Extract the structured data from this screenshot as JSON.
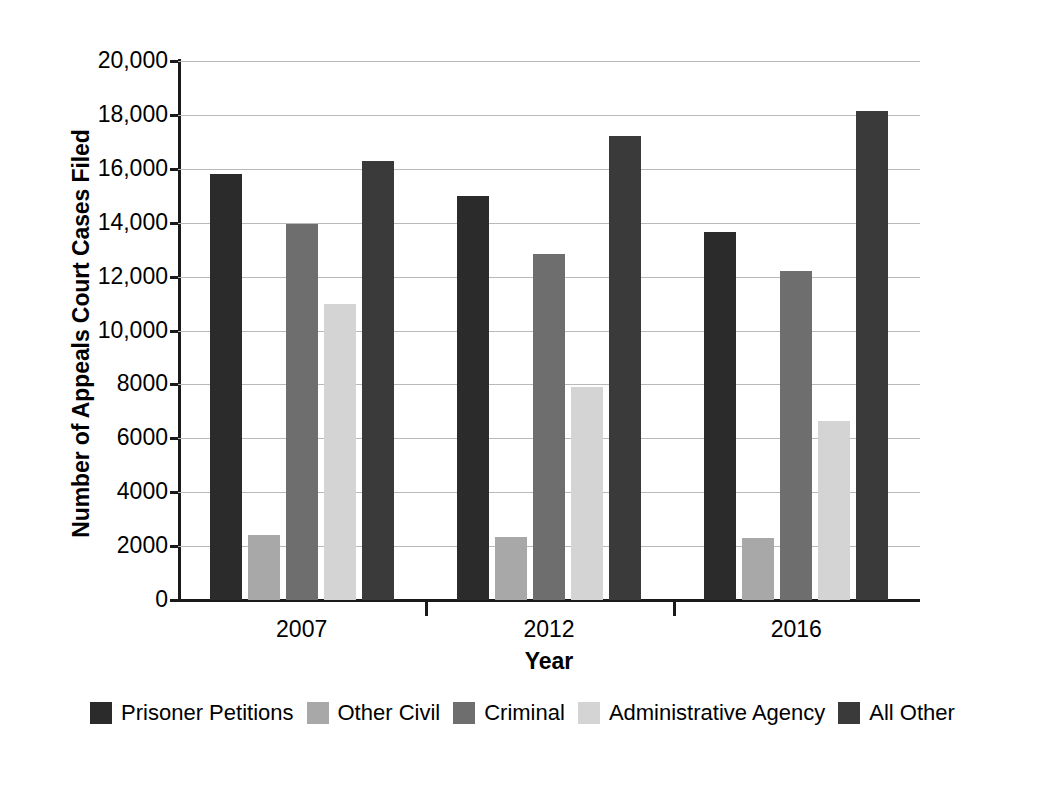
{
  "chart_data": {
    "type": "bar",
    "title": "",
    "xlabel": "Year",
    "ylabel": "Number of Appeals Court Cases Filed",
    "categories": [
      "2007",
      "2012",
      "2016"
    ],
    "ylim": [
      0,
      20000
    ],
    "ytick_values": [
      0,
      2000,
      4000,
      6000,
      8000,
      10000,
      12000,
      14000,
      16000,
      18000,
      20000
    ],
    "ytick_labels": [
      "0",
      "2000",
      "4000",
      "6000",
      "8000",
      "10,000",
      "12,000",
      "14,000",
      "16,000",
      "18,000",
      "20,000"
    ],
    "grid": true,
    "legend_position": "bottom",
    "series": [
      {
        "name": "Prisoner Petitions",
        "color": "#2b2b2b",
        "values": [
          15800,
          15000,
          13650
        ]
      },
      {
        "name": "Other Civil",
        "color": "#a8a8a8",
        "values": [
          2400,
          2350,
          2300
        ]
      },
      {
        "name": "Criminal",
        "color": "#6e6e6e",
        "values": [
          13950,
          12850,
          12200
        ]
      },
      {
        "name": "Administrative Agency",
        "color": "#d4d4d4",
        "values": [
          11000,
          7900,
          6650
        ]
      },
      {
        "name": "All Other",
        "color": "#3a3a3a",
        "values": [
          16300,
          17200,
          18150
        ]
      }
    ]
  }
}
